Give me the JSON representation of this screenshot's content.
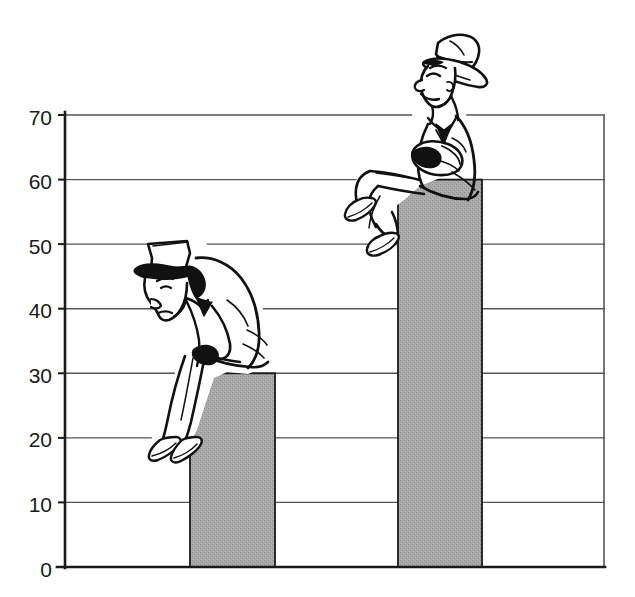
{
  "figure": {
    "name": "bar-chart-with-cartoon-figures",
    "background_color": "#ffffff",
    "line_color": "#1a1a1a",
    "gridline_color": "#555555",
    "bar_fill_color": "#a3a3a3",
    "bar_edge_color": "#1a1a1a",
    "ink_color": "#111111"
  },
  "chart_data": {
    "type": "bar",
    "title": "",
    "subtitle": "",
    "xlabel": "",
    "ylabel": "",
    "categories": [
      "",
      ""
    ],
    "values": [
      30,
      60
    ],
    "ylim": [
      0,
      70
    ],
    "yticks": [
      0,
      10,
      20,
      30,
      40,
      50,
      60,
      70
    ],
    "ytick_labels": [
      "0",
      "10",
      "20",
      "30",
      "40",
      "50",
      "60",
      "70"
    ],
    "xtick_labels": [],
    "grid": true,
    "grid_axis": "y",
    "legend": false,
    "legend_position": "none",
    "annotations": [
      {
        "name": "dejected-man-figure",
        "description": "Cartoon man in hat slumped forward, head down, sitting on the 30 bar",
        "mood": "dejected",
        "sits_on_bar_index": 0
      },
      {
        "name": "cheerful-man-figure",
        "description": "Cartoon man in fedora leaning back, smiling, arms crossed, sitting on the 60 bar",
        "mood": "cheerful",
        "sits_on_bar_index": 1
      }
    ]
  },
  "axis": {
    "y_axis_label": "",
    "x_axis_label": "",
    "tick_font_size": 21
  }
}
